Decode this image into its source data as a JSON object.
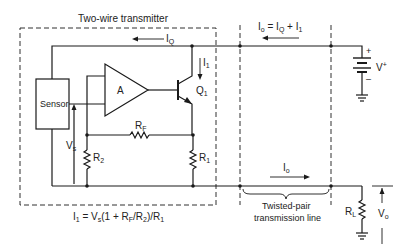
{
  "title": "Two-wire transmitter",
  "blocks": {
    "sensor": "Sensor",
    "amplifier": "A",
    "transistor": "Q",
    "transistor_sub": "1"
  },
  "components": {
    "rf": {
      "main": "R",
      "sub": "F"
    },
    "r1": {
      "main": "R",
      "sub": "1"
    },
    "r2": {
      "main": "R",
      "sub": "2"
    },
    "rl": {
      "main": "R",
      "sub": "L"
    }
  },
  "currents": {
    "iq": {
      "main": "I",
      "sub": "Q"
    },
    "i1": {
      "main": "I",
      "sub": "1"
    },
    "io_top": {
      "text": "I",
      "sub": "o",
      "rest": " = I",
      "rest_sub": "Q",
      "rest2": " + I",
      "rest2_sub": "1"
    },
    "io_bottom": {
      "main": "I",
      "sub": "o"
    }
  },
  "voltages": {
    "vs": {
      "main": "V",
      "sub": "s"
    },
    "vplus": {
      "main": "V",
      "sup": "+"
    },
    "vo": {
      "main": "V",
      "sub": "o"
    },
    "plus": "+",
    "minus": "–"
  },
  "equation": {
    "p1": "I",
    "p1_sub": "1",
    "p2": " = V",
    "p2_sub": "s",
    "p3": "(1 + R",
    "p3_sub": "F",
    "p4": "/R",
    "p4_sub": "2",
    "p5": ")/R",
    "p5_sub": "1"
  },
  "transmission_line": {
    "line1": "Twisted-pair",
    "line2": "transmission line"
  },
  "colors": {
    "line": "#1a1a1a",
    "background": "#ffffff"
  }
}
